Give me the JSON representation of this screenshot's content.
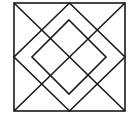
{
  "diagram": {
    "stroke_color": "#1a1a1a",
    "background": "#ffffff",
    "outer_square": {
      "x1": 14,
      "y1": 3,
      "x2": 125,
      "y2": 111
    },
    "outer_diamond": [
      [
        69.5,
        3
      ],
      [
        125,
        57
      ],
      [
        69.5,
        111
      ],
      [
        14,
        57
      ]
    ],
    "inner_diamond": [
      [
        69,
        20
      ],
      [
        106,
        57
      ],
      [
        69,
        94
      ],
      [
        32,
        57
      ]
    ],
    "diagonals": [
      [
        [
          14,
          3
        ],
        [
          125,
          111
        ]
      ],
      [
        [
          125,
          3
        ],
        [
          14,
          111
        ]
      ]
    ]
  }
}
